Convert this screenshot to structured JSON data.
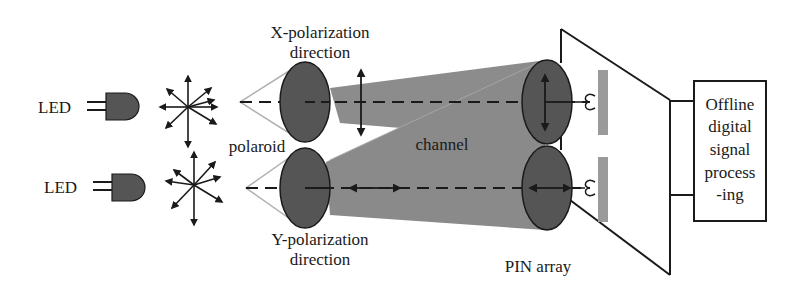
{
  "diagram": {
    "transmitters": [
      {
        "label": "LED"
      },
      {
        "label": "LED"
      }
    ],
    "polarizer_label": "polaroid",
    "x_polarization": {
      "line1": "X-polarization",
      "line2": "direction"
    },
    "y_polarization": {
      "line1": "Y-polarization",
      "line2": "direction"
    },
    "channel_label": "channel",
    "receiver_label": "PIN array",
    "processor": {
      "lines": [
        "Offline",
        "digital",
        "signal",
        "process",
        "-ing"
      ]
    },
    "colors": {
      "ellipse_fill": "#555555",
      "beam_fill": "#8c8c8c",
      "pin_fill": "#9a9a9a",
      "cone_stroke": "#b0b0b0",
      "line": "#1a1a1a"
    }
  }
}
